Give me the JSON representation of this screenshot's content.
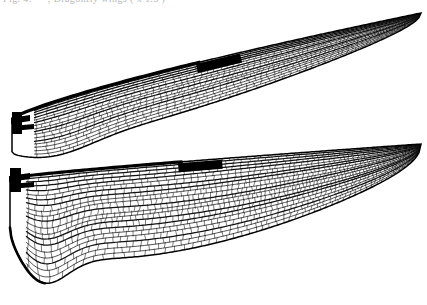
{
  "figure": {
    "kind": "scientific-line-drawing",
    "title_fragment": "Fig. 4. — , Dragonfly wings ( x 1.5 )",
    "background_color": "#ffffff",
    "ink_color": "#000000",
    "canvas": {
      "width": 427,
      "height": 305
    }
  },
  "wings": [
    {
      "id": "forewing",
      "label": "forewing",
      "base_x": 10,
      "tip_x": 421,
      "leading_peak_y": 13,
      "base_y": 122,
      "trailing_y": 158,
      "pterostigma": {
        "x": 196,
        "y": 34,
        "length": 44,
        "thickness": 9
      },
      "nodus": {
        "x": 196,
        "y": 44
      },
      "cell_density": "dense-reticulate"
    },
    {
      "id": "hindwing",
      "label": "hindwing",
      "base_x": 8,
      "tip_x": 421,
      "leading_peak_y": 152,
      "base_y": 176,
      "trailing_y": 298,
      "pterostigma": {
        "x": 178,
        "y": 160,
        "length": 44,
        "thickness": 9
      },
      "nodus": {
        "x": 178,
        "y": 170
      },
      "cell_density": "dense-reticulate",
      "anal_field": "expanded"
    }
  ],
  "colors": {
    "ink": "#000000",
    "vein_major": "#111111",
    "vein_minor": "#2a2a2a",
    "membrane": "#ffffff",
    "caption": "#b9b9b9"
  }
}
